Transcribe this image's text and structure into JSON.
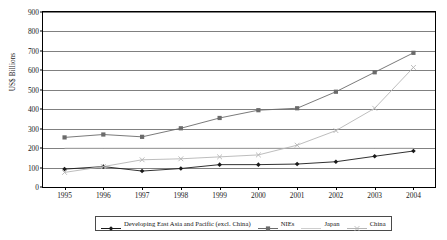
{
  "chart_data": {
    "type": "line",
    "title": "",
    "xlabel": "",
    "ylabel": "US$ Billions",
    "categories": [
      "1995",
      "1996",
      "1997",
      "1998",
      "1999",
      "2000",
      "2001",
      "2002",
      "2003",
      "2004"
    ],
    "ylim": [
      0,
      900
    ],
    "ytick_step": 100,
    "yticks": [
      "0",
      "100",
      "200",
      "300",
      "400",
      "500",
      "600",
      "700",
      "800",
      "900"
    ],
    "grid": true,
    "legend_position": "bottom",
    "series": [
      {
        "name": "Developing East Asia and Pacific (excl. China)",
        "marker": "diamond",
        "color": "#1a1a1a",
        "values": [
          92,
          105,
          82,
          95,
          115,
          115,
          118,
          130,
          158,
          185
        ]
      },
      {
        "name": "NIEs",
        "marker": "square",
        "color": "#6b6b6b",
        "values": [
          255,
          270,
          258,
          302,
          355,
          395,
          405,
          490,
          590,
          690
        ]
      },
      {
        "name": "Japan",
        "marker": "none",
        "color": "#c2c2c2",
        "values": [
          200,
          200,
          200,
          200,
          200,
          200,
          200,
          200,
          200,
          200
        ]
      },
      {
        "name": "China",
        "marker": "cross",
        "color": "#b5b5b5",
        "values": [
          75,
          105,
          140,
          145,
          155,
          165,
          215,
          290,
          405,
          615
        ]
      }
    ]
  },
  "axes": {
    "y_axis_title": "US$ Billions"
  },
  "legend": {
    "entries": [
      {
        "label": "Developing East Asia and Pacific (excl. China)"
      },
      {
        "label": "NIEs"
      },
      {
        "label": "Japan"
      },
      {
        "label": "China"
      }
    ]
  }
}
